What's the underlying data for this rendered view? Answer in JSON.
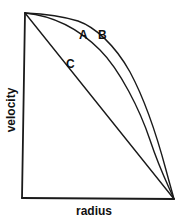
{
  "diagram": {
    "type": "velocity-profile",
    "axes": {
      "x_label": "radius",
      "y_label": "velocity"
    },
    "curves": [
      {
        "id": "A",
        "label": "A",
        "shape": "convex curve (intermediate)"
      },
      {
        "id": "B",
        "label": "B",
        "shape": "convex curve (flattest top, plug-like)"
      },
      {
        "id": "C",
        "label": "C",
        "shape": "straight line (linear)"
      }
    ],
    "colors": {
      "line": "#1a1a1a",
      "background": "#ffffff"
    }
  }
}
